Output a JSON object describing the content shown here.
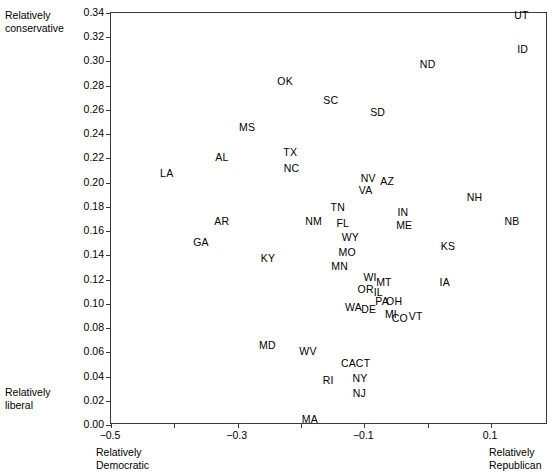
{
  "chart_data": {
    "type": "scatter",
    "title": "",
    "subtitle": "",
    "xlabel": "",
    "ylabel": "",
    "xlim": [
      -0.5,
      0.19
    ],
    "ylim": [
      0.0,
      0.34
    ],
    "grid": false,
    "legend": null,
    "marker_style": "text-label-only",
    "xticks": [
      -0.5,
      -0.3,
      -0.1,
      0.1
    ],
    "xtick_labels": [
      "-0.5",
      "-0.3",
      "-0.1",
      "0.1"
    ],
    "yticks": [
      0.0,
      0.02,
      0.04,
      0.06,
      0.08,
      0.1,
      0.12,
      0.14,
      0.16,
      0.18,
      0.2,
      0.22,
      0.24,
      0.26,
      0.28,
      0.3,
      0.32,
      0.34
    ],
    "ytick_labels": [
      "0.00",
      "0.02",
      "0.04",
      "0.06",
      "0.08",
      "0.10",
      "0.12",
      "0.14",
      "0.16",
      "0.18",
      "0.20",
      "0.22",
      "0.24",
      "0.26",
      "0.28",
      "0.30",
      "0.32",
      "0.34"
    ],
    "annotations": {
      "top_left": "Relatively\nconservative",
      "bottom_left": "Relatively\nliberal",
      "x_axis_left": "Relatively\nDemocratic",
      "x_axis_right": "Relatively\nRepublican"
    },
    "points": [
      {
        "label": "UT",
        "x": 0.148,
        "y": 0.338
      },
      {
        "label": "ID",
        "x": 0.15,
        "y": 0.31
      },
      {
        "label": "ND",
        "x": 0.0,
        "y": 0.298
      },
      {
        "label": "OK",
        "x": -0.225,
        "y": 0.284
      },
      {
        "label": "SC",
        "x": -0.153,
        "y": 0.268
      },
      {
        "label": "SD",
        "x": -0.079,
        "y": 0.258
      },
      {
        "label": "MS",
        "x": -0.285,
        "y": 0.246
      },
      {
        "label": "TX",
        "x": -0.217,
        "y": 0.225
      },
      {
        "label": "AL",
        "x": -0.325,
        "y": 0.221
      },
      {
        "label": "NC",
        "x": -0.215,
        "y": 0.212
      },
      {
        "label": "LA",
        "x": -0.412,
        "y": 0.208
      },
      {
        "label": "NV",
        "x": -0.094,
        "y": 0.204
      },
      {
        "label": "AZ",
        "x": -0.064,
        "y": 0.201
      },
      {
        "label": "VA",
        "x": -0.098,
        "y": 0.194
      },
      {
        "label": "NH",
        "x": 0.074,
        "y": 0.188
      },
      {
        "label": "TN",
        "x": -0.142,
        "y": 0.18
      },
      {
        "label": "IN",
        "x": -0.039,
        "y": 0.176
      },
      {
        "label": "AR",
        "x": -0.325,
        "y": 0.168
      },
      {
        "label": "NM",
        "x": -0.18,
        "y": 0.168
      },
      {
        "label": "NB",
        "x": 0.133,
        "y": 0.168
      },
      {
        "label": "FL",
        "x": -0.134,
        "y": 0.167
      },
      {
        "label": "ME",
        "x": -0.037,
        "y": 0.165
      },
      {
        "label": "WY",
        "x": -0.122,
        "y": 0.155
      },
      {
        "label": "GA",
        "x": -0.358,
        "y": 0.151
      },
      {
        "label": "KS",
        "x": 0.032,
        "y": 0.148
      },
      {
        "label": "MO",
        "x": -0.127,
        "y": 0.143
      },
      {
        "label": "KY",
        "x": -0.252,
        "y": 0.138
      },
      {
        "label": "MN",
        "x": -0.139,
        "y": 0.131
      },
      {
        "label": "WI",
        "x": -0.091,
        "y": 0.122
      },
      {
        "label": "MT",
        "x": -0.069,
        "y": 0.118
      },
      {
        "label": "IA",
        "x": 0.027,
        "y": 0.118
      },
      {
        "label": "OR",
        "x": -0.098,
        "y": 0.112
      },
      {
        "label": "IL",
        "x": -0.078,
        "y": 0.11
      },
      {
        "label": "PA",
        "x": -0.072,
        "y": 0.102
      },
      {
        "label": "OH",
        "x": -0.053,
        "y": 0.102
      },
      {
        "label": "WA",
        "x": -0.117,
        "y": 0.097
      },
      {
        "label": "DE",
        "x": -0.093,
        "y": 0.096
      },
      {
        "label": "MI",
        "x": -0.058,
        "y": 0.092
      },
      {
        "label": "CO",
        "x": -0.044,
        "y": 0.088
      },
      {
        "label": "VT",
        "x": -0.019,
        "y": 0.09
      },
      {
        "label": "MD",
        "x": -0.253,
        "y": 0.066
      },
      {
        "label": "WV",
        "x": -0.189,
        "y": 0.061
      },
      {
        "label": "CA",
        "x": -0.125,
        "y": 0.051
      },
      {
        "label": "CT",
        "x": -0.102,
        "y": 0.051
      },
      {
        "label": "NY",
        "x": -0.107,
        "y": 0.039
      },
      {
        "label": "RI",
        "x": -0.157,
        "y": 0.037
      },
      {
        "label": "NJ",
        "x": -0.108,
        "y": 0.026
      },
      {
        "label": "MA",
        "x": -0.186,
        "y": 0.005
      }
    ]
  }
}
